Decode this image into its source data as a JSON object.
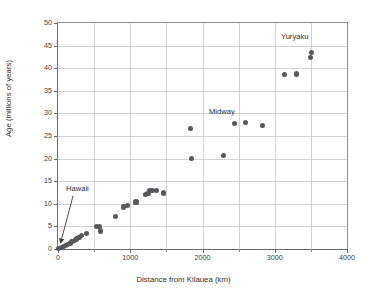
{
  "chart_data": {
    "type": "scatter",
    "title": "",
    "xlabel": "Distance from Kilauea (km)",
    "ylabel": "Age (millions of years)",
    "xlim": [
      0,
      4000
    ],
    "ylim": [
      0,
      50
    ],
    "xticks": [
      0,
      1000,
      2000,
      3000,
      4000
    ],
    "xtick_labels": [
      "0",
      "1000",
      "2000",
      "3000",
      "4000"
    ],
    "xminorticks": [
      500,
      1500,
      2500,
      3500
    ],
    "yticks": [
      0,
      5,
      10,
      15,
      20,
      25,
      30,
      35,
      40,
      45,
      50
    ],
    "ytick_labels": [
      "0",
      "5",
      "10",
      "15",
      "20",
      "25",
      "30",
      "35",
      "40",
      "45",
      "50"
    ],
    "grid": "both",
    "legend": "none",
    "marker_color": "#58585c",
    "points": [
      {
        "x": 10,
        "y": 0.2
      },
      {
        "x": 45,
        "y": 0.4
      },
      {
        "x": 75,
        "y": 0.5
      },
      {
        "x": 105,
        "y": 0.8
      },
      {
        "x": 135,
        "y": 1.0
      },
      {
        "x": 165,
        "y": 1.3
      },
      {
        "x": 195,
        "y": 1.6
      },
      {
        "x": 225,
        "y": 1.8
      },
      {
        "x": 255,
        "y": 2.2
      },
      {
        "x": 290,
        "y": 2.6
      },
      {
        "x": 330,
        "y": 2.9
      },
      {
        "x": 390,
        "y": 3.5
      },
      {
        "x": 530,
        "y": 4.9
      },
      {
        "x": 570,
        "y": 4.9
      },
      {
        "x": 590,
        "y": 4.0
      },
      {
        "x": 795,
        "y": 7.2
      },
      {
        "x": 910,
        "y": 9.3
      },
      {
        "x": 960,
        "y": 9.7
      },
      {
        "x": 1080,
        "y": 10.4
      },
      {
        "x": 1210,
        "y": 12.0
      },
      {
        "x": 1245,
        "y": 12.3
      },
      {
        "x": 1270,
        "y": 13.0
      },
      {
        "x": 1300,
        "y": 12.9
      },
      {
        "x": 1360,
        "y": 12.9
      },
      {
        "x": 1465,
        "y": 12.4
      },
      {
        "x": 1835,
        "y": 26.6
      },
      {
        "x": 1845,
        "y": 20.0
      },
      {
        "x": 2290,
        "y": 20.6
      },
      {
        "x": 2440,
        "y": 27.7
      },
      {
        "x": 2600,
        "y": 28.0
      },
      {
        "x": 2825,
        "y": 27.4
      },
      {
        "x": 3140,
        "y": 38.6
      },
      {
        "x": 3300,
        "y": 38.7
      },
      {
        "x": 3500,
        "y": 42.3
      },
      {
        "x": 3510,
        "y": 43.4
      }
    ],
    "annotations": [
      {
        "id": "hawaii",
        "text": "Hawaii",
        "points_to_x": 40,
        "points_to_y": 0.6
      },
      {
        "id": "midway",
        "text": "Midway",
        "points_to_x": 2520,
        "points_to_y": 28.0
      },
      {
        "id": "yuryaku",
        "text": "Yuryaku",
        "points_to_x": 3505,
        "points_to_y": 43.0
      }
    ]
  }
}
